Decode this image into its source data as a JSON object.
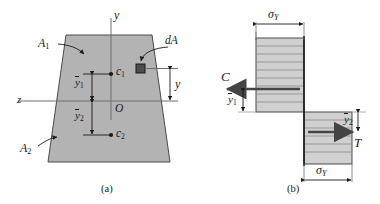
{
  "figure": {
    "panels": [
      {
        "id": "a",
        "caption": "(a)",
        "description": "Trapezoidal cross section divided into areas A1 and A2 by the plastic neutral axis z, with part centroids c1 and c2 and an element of area dA at distance y.",
        "axes": {
          "y_label": "y",
          "z_label": "z",
          "origin_label": "O"
        },
        "labels": {
          "area_upper": "A",
          "area_upper_sub": "1",
          "area_lower": "A",
          "area_lower_sub": "2",
          "centroid_upper": "c",
          "centroid_upper_sub": "1",
          "centroid_lower": "c",
          "centroid_lower_sub": "2",
          "element_area": "dA",
          "dist_upper": "y",
          "dist_upper_sub": "1",
          "dist_lower": "y",
          "dist_lower_sub": "2",
          "dist_element": "y"
        }
      },
      {
        "id": "b",
        "caption": "(b)",
        "description": "Fully plastic stress distribution: uniform compressive stress sigma_Y above the neutral axis giving resultant C, uniform tensile stress sigma_Y below giving resultant T.",
        "labels": {
          "stress_top": "σ",
          "stress_top_sub": "Y",
          "stress_bottom": "σ",
          "stress_bottom_sub": "Y",
          "compression": "C",
          "tension": "T",
          "arm_upper": "y",
          "arm_upper_sub": "1",
          "arm_lower": "y",
          "arm_lower_sub": "2"
        },
        "hatch_lines_upper": 9,
        "hatch_lines_lower": 6
      }
    ],
    "colors": {
      "section_fill": "#b3b3b3",
      "stress_fill": "#d0d0d0",
      "stroke": "#1a1a1a",
      "thin_stroke": "#555555",
      "element_fill": "#4d4d4d",
      "background": "#ffffff"
    }
  }
}
